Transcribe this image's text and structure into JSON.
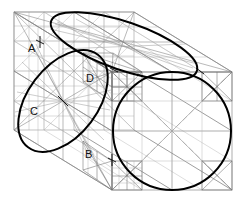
{
  "figure": {
    "type": "technical-line-drawing",
    "canvas": {
      "width": 248,
      "height": 202,
      "background": "#ffffff"
    },
    "colors": {
      "outline": "#000000",
      "construction": "#8a8a8a",
      "construction_light": "#b4b4b4",
      "label": "#111111"
    },
    "stroke_widths": {
      "conic_heavy": 2.0,
      "box_edge": 0.9,
      "construction": 0.6,
      "construction_fine": 0.45
    },
    "labels": [
      {
        "id": "A",
        "text": "A",
        "x": 28,
        "y": 52
      },
      {
        "id": "D",
        "text": "D",
        "x": 86,
        "y": 82
      },
      {
        "id": "C",
        "text": "C",
        "x": 30,
        "y": 115
      },
      {
        "id": "B",
        "text": "B",
        "x": 85,
        "y": 158
      }
    ],
    "box": {
      "front_face": {
        "x": 112,
        "y": 72,
        "width": 120,
        "height": 118
      },
      "back_face": {
        "x": 14,
        "y": 12,
        "width": 120,
        "height": 118
      },
      "depth_vector": {
        "dx": -98,
        "dy": -60
      }
    },
    "conics": [
      {
        "name": "left-face-ellipse",
        "cx": 63,
        "cy": 101,
        "rx": 58,
        "ry": 35,
        "rotation": -53,
        "tangent_points": [
          "A",
          "B",
          "C",
          "D"
        ]
      },
      {
        "name": "top-face-ellipse",
        "cx": 124,
        "cy": 46,
        "rx": 77,
        "ry": 24,
        "rotation": 19
      },
      {
        "name": "front-face-circle",
        "cx": 172,
        "cy": 131,
        "r": 59
      }
    ]
  }
}
